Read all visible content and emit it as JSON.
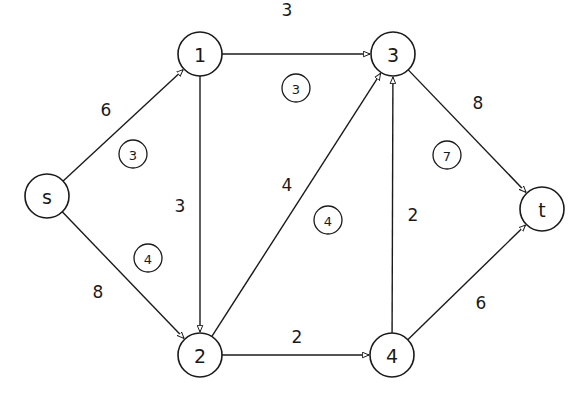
{
  "diagram": {
    "type": "directed-flow-network",
    "nodes": [
      {
        "id": "s",
        "label": "s",
        "x": 47,
        "y": 196
      },
      {
        "id": "1",
        "label": "1",
        "x": 200,
        "y": 54
      },
      {
        "id": "3",
        "label": "3",
        "x": 393,
        "y": 54
      },
      {
        "id": "t",
        "label": "t",
        "x": 542,
        "y": 209
      },
      {
        "id": "2",
        "label": "2",
        "x": 200,
        "y": 355
      },
      {
        "id": "4",
        "label": "4",
        "x": 392,
        "y": 355
      }
    ],
    "node_radius": 22,
    "edges": [
      {
        "from": "s",
        "to": "1",
        "weight": "6",
        "label_x": 106,
        "label_y": 110
      },
      {
        "from": "s",
        "to": "2",
        "weight": "8",
        "label_x": 98,
        "label_y": 292
      },
      {
        "from": "1",
        "to": "3",
        "weight": "3",
        "label_x": 287,
        "label_y": 10
      },
      {
        "from": "1",
        "to": "2",
        "weight": "3",
        "label_x": 180,
        "label_y": 206
      },
      {
        "from": "2",
        "to": "3",
        "weight": "4",
        "label_x": 287,
        "label_y": 185
      },
      {
        "from": "2",
        "to": "4",
        "weight": "2",
        "label_x": 297,
        "label_y": 337
      },
      {
        "from": "4",
        "to": "3",
        "weight": "2",
        "label_x": 413,
        "label_y": 215
      },
      {
        "from": "3",
        "to": "t",
        "weight": "8",
        "label_x": 478,
        "label_y": 103
      },
      {
        "from": "4",
        "to": "t",
        "weight": "6",
        "label_x": 481,
        "label_y": 303
      }
    ],
    "regions": [
      {
        "label": "3",
        "x": 133,
        "y": 154
      },
      {
        "label": "4",
        "x": 148,
        "y": 258
      },
      {
        "label": "3",
        "x": 296,
        "y": 88
      },
      {
        "label": "4",
        "x": 328,
        "y": 220
      },
      {
        "label": "7",
        "x": 447,
        "y": 155
      }
    ],
    "region_radius": 14,
    "colors": {
      "stroke": "#1a1a1a",
      "background": "#ffffff"
    }
  }
}
